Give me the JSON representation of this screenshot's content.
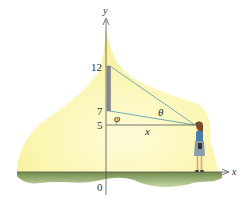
{
  "diagram": {
    "axes": {
      "x_label": "x",
      "y_label": "y",
      "origin_label": "0"
    },
    "y_ticks": [
      {
        "label": "12",
        "value": 12
      },
      {
        "label": "7",
        "value": 7
      },
      {
        "label": "5",
        "value": 5
      }
    ],
    "angles": {
      "theta": "θ",
      "phi": "φ"
    },
    "distance_label": "x",
    "elements": {
      "screen": "vertical bar from y=7 to y=12 on the y-axis",
      "viewer": "person standing on ground at distance x, eye level y=5"
    },
    "colors": {
      "glow": "#fbf6b0",
      "ground": "#8ea86a",
      "lines": "#6aa0b0",
      "screen": "#8a8a8a",
      "axis": "#555555"
    }
  }
}
